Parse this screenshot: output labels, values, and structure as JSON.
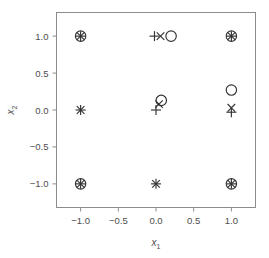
{
  "chart_data": {
    "type": "scatter",
    "title": "",
    "xlabel": "x1",
    "ylabel": "x2",
    "xlabel_base": "x",
    "xlabel_sub": "1",
    "ylabel_base": "x",
    "ylabel_sub": "2",
    "xlim": [
      -1.32,
      1.32
    ],
    "ylim": [
      -1.32,
      1.32
    ],
    "xticks": [
      -1.0,
      -0.5,
      0.0,
      0.5,
      1.0
    ],
    "xtick_labels": [
      "−1.0",
      "−0.5",
      "0.0",
      "0.5",
      "1.0"
    ],
    "yticks": [
      -1.0,
      -0.5,
      0.0,
      0.5,
      1.0
    ],
    "ytick_labels": [
      "1.0",
      "0.5",
      "0.0",
      "−0.5",
      "−1.0"
    ],
    "grid": false,
    "legend": "none",
    "frame": true,
    "marker_color": "#333333",
    "frame_color": "#8c8c8c",
    "series": [
      {
        "name": "circle",
        "marker": "circle",
        "points": [
          {
            "x": -1.0,
            "y": 1.0
          },
          {
            "x": 0.2,
            "y": 1.0
          },
          {
            "x": 1.0,
            "y": 1.0
          },
          {
            "x": 0.07,
            "y": 0.13
          },
          {
            "x": 1.0,
            "y": 0.27
          },
          {
            "x": -1.0,
            "y": -1.0
          },
          {
            "x": 1.0,
            "y": -1.0
          }
        ]
      },
      {
        "name": "plus",
        "marker": "plus",
        "points": [
          {
            "x": -1.0,
            "y": 1.0
          },
          {
            "x": -0.02,
            "y": 1.0
          },
          {
            "x": 1.0,
            "y": 1.0
          },
          {
            "x": -1.0,
            "y": 0.0
          },
          {
            "x": 0.0,
            "y": 0.0
          },
          {
            "x": 1.0,
            "y": -0.03
          },
          {
            "x": -1.0,
            "y": -1.0
          },
          {
            "x": 0.0,
            "y": -1.0
          },
          {
            "x": 1.0,
            "y": -1.0
          }
        ]
      },
      {
        "name": "cross",
        "marker": "cross",
        "points": [
          {
            "x": -1.0,
            "y": 1.0
          },
          {
            "x": 0.06,
            "y": 1.0
          },
          {
            "x": 1.0,
            "y": 1.0
          },
          {
            "x": -1.0,
            "y": 0.0
          },
          {
            "x": 0.04,
            "y": 0.08
          },
          {
            "x": 1.0,
            "y": 0.03
          },
          {
            "x": -1.0,
            "y": -1.0
          },
          {
            "x": 0.0,
            "y": -1.0
          },
          {
            "x": 1.0,
            "y": -1.0
          }
        ]
      }
    ]
  }
}
